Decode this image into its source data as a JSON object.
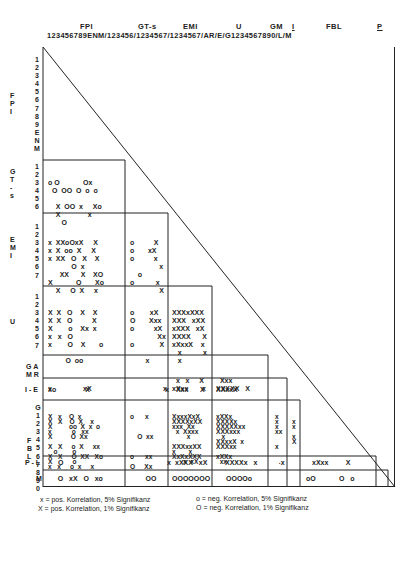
{
  "header": {
    "groups": [
      "FPI",
      "GT-s",
      "EMI",
      "U",
      "GM",
      "I",
      "FBL",
      "P"
    ],
    "index_line": "123456789ENM/123456/1234567/1234567/AR/E/G1234567890/L/M"
  },
  "row_labels": {
    "FPI": [
      "1",
      "2",
      "3",
      "4",
      "5",
      "6",
      "7",
      "8",
      "9",
      "E",
      "N",
      "M"
    ],
    "GT-s": [
      "1",
      "2",
      "3",
      "4",
      "5",
      "6"
    ],
    "EMI": [
      "1",
      "2",
      "3",
      "4",
      "5",
      "6",
      "7"
    ],
    "U": [
      "1",
      "2",
      "3",
      "4",
      "5",
      "6",
      "7"
    ],
    "GM": [
      "A",
      "R"
    ],
    "I": [
      "E"
    ],
    "FBL": [
      "G",
      "1",
      "2",
      "3",
      "4",
      "5",
      "6",
      "7",
      "8",
      "9",
      "0"
    ],
    "P": [
      "L"
    ],
    "M": [
      "M"
    ]
  },
  "group_titles": {
    "fpi": "F P I",
    "gts": "G T - s",
    "emi": "E M I",
    "u": "U",
    "gm": "G M",
    "i": "I -",
    "fbl": "F B L",
    "pl": "P - L",
    "m": "M"
  },
  "matrix": {
    "GTs_FPI": [
      "o O            Ox",
      "  O  OO  O  o  o",
      "",
      "    X  OO  x     Xo",
      "    X              x",
      "       O"
    ],
    "EMI_FPI": [
      "x  XXoOxX     X",
      "x  X  oo  X     X",
      "x  XX   O   X    X",
      "            O  x",
      "      XX      X    XO",
      "X            O       Xo",
      "    X     O  X     x"
    ],
    "EMI_GTs": [
      "o          X",
      "o       xX",
      "o          x",
      "               x",
      "    o",
      "o           x",
      "               X"
    ],
    "U_FPI": [
      "X  X   O    X    X",
      "X  X   O          X",
      "X        o    Xx  x",
      "x   x   O",
      "x        O    X       o",
      "",
      "         O  oo"
    ],
    "U_GTs": [
      "o        xX",
      "O       Xxx",
      "o          xX",
      "              Xx",
      "o             X",
      "",
      "        x"
    ],
    "U_EMI": [
      "XXXxXXX",
      "XXX   xXX",
      "xXXX   xX",
      "XXXX      X",
      "xXxxX    x",
      "   x           x",
      "   x"
    ],
    "GM_FPI": [
      "",
      "x                xX"
    ],
    "GM_GTs": [
      "",
      "                 x"
    ],
    "GM_EMI": [
      "  x   x     X",
      "xXxx       x"
    ],
    "GM_U": [
      "  Xxx",
      "XXXXX   X"
    ],
    "I_FPI": [
      "xo               X"
    ],
    "I_GTs": [
      "                  x"
    ],
    "I_EMI": [
      "  Xxx      X"
    ],
    "I_U": [
      "XXxxX"
    ],
    "FBL_FPI": [
      "X   x    O  x",
      "X   X    O  X    x",
      "X         oo  X  x  o",
      "x           o   xx",
      "X          O  Xx",
      "",
      "X   X     o  X     xx",
      "   o        o",
      "X   X     O  XX   Xo",
      "X           o",
      "x   x     o  x     x"
    ],
    "FBL_GTs": [
      "o      x",
      "",
      "",
      "",
      "    O  xx",
      "",
      "",
      "",
      "o      xx",
      "",
      "O     Xx"
    ],
    "FBL_EMI": [
      "XxxxXxX",
      "XXXXxXX",
      "xxx  Xx",
      "  x  Xxxx",
      "        x",
      "",
      "XXXxxXX",
      "x       x",
      "XxXxXXX",
      "      x  xX",
      ""
    ],
    "FBL_U": [
      "xXXx",
      "XXXXx",
      "XXXXXxx",
      "XXXxxx",
      "   x",
      "XXxxX  x",
      "XXXxx",
      "",
      "xXXx",
      "  xx",
      ""
    ],
    "FBL_GM": [
      "x",
      "x",
      "x",
      "xx",
      "",
      "",
      "x",
      "",
      "",
      "  .",
      ""
    ],
    "FBL_I": [
      "",
      "x",
      "x",
      "",
      "x",
      "X",
      "",
      "",
      "",
      "",
      ""
    ],
    "PL_FPI": [
      "O"
    ],
    "PL_GTs": [
      "                   x"
    ],
    "PL_EMI": [
      "xXXX   xX"
    ],
    "PL_U": [
      "XXXXx   x"
    ],
    "PL_GM": [
      "   x"
    ],
    "PL_FBL": [
      "xXxx         X"
    ],
    "M_FPI": [
      "     O   xX   O   xo"
    ],
    "M_GTs": [
      "        OO"
    ],
    "M_EMI": [
      "OOOOOOO"
    ],
    "M_U": [
      "OOOOo"
    ],
    "M_FBL": [
      "oO            O   o"
    ]
  },
  "legend": {
    "pos5": "x = pos. Korrelation, 5% Signifikanz",
    "pos1": "X = pos. Korrelation, 1% Signifikanz",
    "neg5": "o = neg. Korrelation, 5% Signifikanz",
    "neg1": "O = neg. Korrelation, 1% Signifikanz"
  }
}
